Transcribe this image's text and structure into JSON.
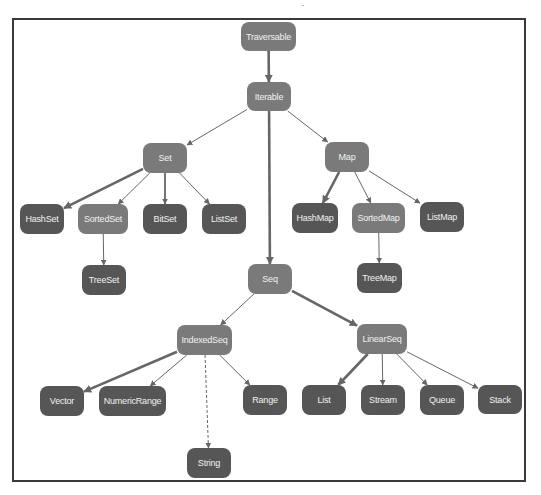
{
  "diagram": {
    "title": "",
    "colors": {
      "trait_node": "#7a7a7a",
      "concrete_node": "#565656",
      "node_text": "#f2f2f2",
      "edge": "#666666",
      "frame": "#3a3a3a"
    },
    "nodes": [
      {
        "id": "traversable",
        "label": "Traversable",
        "kind": "trait",
        "x": 241,
        "y": 22,
        "w": 55,
        "h": 29
      },
      {
        "id": "iterable",
        "label": "Iterable",
        "kind": "trait",
        "x": 247,
        "y": 82,
        "w": 44,
        "h": 29
      },
      {
        "id": "set",
        "label": "Set",
        "kind": "trait",
        "x": 143,
        "y": 143,
        "w": 44,
        "h": 30
      },
      {
        "id": "map",
        "label": "Map",
        "kind": "trait",
        "x": 325,
        "y": 142,
        "w": 44,
        "h": 30
      },
      {
        "id": "hashset",
        "label": "HashSet",
        "kind": "concrete",
        "x": 20,
        "y": 204,
        "w": 44,
        "h": 30
      },
      {
        "id": "sortedset",
        "label": "SortedSet",
        "kind": "trait",
        "x": 78,
        "y": 204,
        "w": 50,
        "h": 30
      },
      {
        "id": "bitset",
        "label": "BitSet",
        "kind": "concrete",
        "x": 143,
        "y": 204,
        "w": 44,
        "h": 30
      },
      {
        "id": "listset",
        "label": "ListSet",
        "kind": "concrete",
        "x": 202,
        "y": 204,
        "w": 44,
        "h": 30
      },
      {
        "id": "hashmap",
        "label": "HashMap",
        "kind": "concrete",
        "x": 292,
        "y": 203,
        "w": 46,
        "h": 30
      },
      {
        "id": "sortedmap",
        "label": "SortedMap",
        "kind": "trait",
        "x": 352,
        "y": 203,
        "w": 53,
        "h": 30
      },
      {
        "id": "listmap",
        "label": "ListMap",
        "kind": "concrete",
        "x": 420,
        "y": 202,
        "w": 44,
        "h": 30
      },
      {
        "id": "treeset",
        "label": "TreeSet",
        "kind": "concrete",
        "x": 82,
        "y": 265,
        "w": 44,
        "h": 30
      },
      {
        "id": "seq",
        "label": "Seq",
        "kind": "trait",
        "x": 248,
        "y": 264,
        "w": 44,
        "h": 30
      },
      {
        "id": "treemap",
        "label": "TreeMap",
        "kind": "concrete",
        "x": 357,
        "y": 263,
        "w": 45,
        "h": 30
      },
      {
        "id": "indexedseq",
        "label": "IndexedSeq",
        "kind": "trait",
        "x": 177,
        "y": 325,
        "w": 55,
        "h": 30
      },
      {
        "id": "linearseq",
        "label": "LinearSeq",
        "kind": "trait",
        "x": 357,
        "y": 324,
        "w": 50,
        "h": 30
      },
      {
        "id": "vector",
        "label": "Vector",
        "kind": "concrete",
        "x": 40,
        "y": 386,
        "w": 44,
        "h": 30
      },
      {
        "id": "numericrange",
        "label": "NumericRange",
        "kind": "concrete",
        "x": 99,
        "y": 386,
        "w": 67,
        "h": 30
      },
      {
        "id": "range",
        "label": "Range",
        "kind": "concrete",
        "x": 243,
        "y": 385,
        "w": 44,
        "h": 30
      },
      {
        "id": "list",
        "label": "List",
        "kind": "concrete",
        "x": 302,
        "y": 385,
        "w": 44,
        "h": 30
      },
      {
        "id": "stream",
        "label": "Stream",
        "kind": "concrete",
        "x": 361,
        "y": 385,
        "w": 44,
        "h": 30
      },
      {
        "id": "queue",
        "label": "Queue",
        "kind": "concrete",
        "x": 420,
        "y": 385,
        "w": 44,
        "h": 30
      },
      {
        "id": "stack",
        "label": "Stack",
        "kind": "concrete",
        "x": 478,
        "y": 385,
        "w": 44,
        "h": 29
      },
      {
        "id": "string",
        "label": "String",
        "kind": "concrete",
        "x": 187,
        "y": 448,
        "w": 44,
        "h": 30
      }
    ],
    "edges": [
      {
        "from": "traversable",
        "to": "iterable",
        "style": "thick"
      },
      {
        "from": "iterable",
        "to": "set",
        "style": "thin"
      },
      {
        "from": "iterable",
        "to": "map",
        "style": "thin"
      },
      {
        "from": "iterable",
        "to": "seq",
        "style": "thick"
      },
      {
        "from": "set",
        "to": "hashset",
        "style": "thick"
      },
      {
        "from": "set",
        "to": "sortedset",
        "style": "thin"
      },
      {
        "from": "set",
        "to": "bitset",
        "style": "medium"
      },
      {
        "from": "set",
        "to": "listset",
        "style": "thin"
      },
      {
        "from": "sortedset",
        "to": "treeset",
        "style": "thin"
      },
      {
        "from": "map",
        "to": "hashmap",
        "style": "thick"
      },
      {
        "from": "map",
        "to": "sortedmap",
        "style": "thin"
      },
      {
        "from": "map",
        "to": "listmap",
        "style": "thin"
      },
      {
        "from": "sortedmap",
        "to": "treemap",
        "style": "thin"
      },
      {
        "from": "seq",
        "to": "indexedseq",
        "style": "thin"
      },
      {
        "from": "seq",
        "to": "linearseq",
        "style": "thick"
      },
      {
        "from": "indexedseq",
        "to": "vector",
        "style": "thick"
      },
      {
        "from": "indexedseq",
        "to": "numericrange",
        "style": "thin"
      },
      {
        "from": "indexedseq",
        "to": "range",
        "style": "thin"
      },
      {
        "from": "indexedseq",
        "to": "string",
        "style": "dashed"
      },
      {
        "from": "linearseq",
        "to": "list",
        "style": "thick"
      },
      {
        "from": "linearseq",
        "to": "stream",
        "style": "thin"
      },
      {
        "from": "linearseq",
        "to": "queue",
        "style": "thin"
      },
      {
        "from": "linearseq",
        "to": "stack",
        "style": "thin"
      }
    ]
  }
}
